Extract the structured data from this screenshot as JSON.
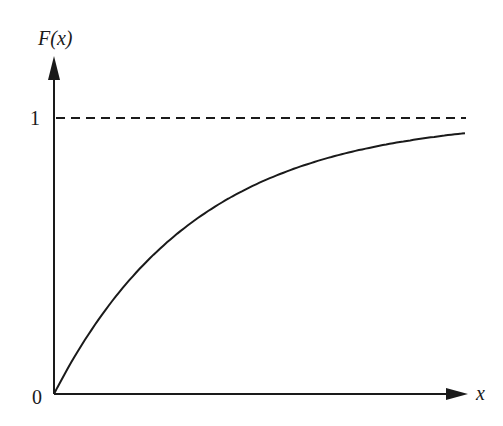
{
  "chart_data": {
    "type": "line",
    "title": "",
    "xlabel": "x",
    "ylabel": "F(x)",
    "y_ticks": [
      "0",
      "1"
    ],
    "x_ticks": [
      "0"
    ],
    "asymptote": {
      "y": 1,
      "style": "dashed"
    },
    "series": [
      {
        "name": "F(x) = 1 - e^(-kx)",
        "x": [
          0,
          0.5,
          1,
          1.5,
          2,
          2.5,
          2.9
        ],
        "values": [
          0,
          0.39,
          0.63,
          0.78,
          0.86,
          0.92,
          0.945
        ]
      }
    ],
    "ylim": [
      0,
      1.15
    ],
    "grid": false,
    "legend": "none"
  },
  "labels": {
    "y_axis": "F(x)",
    "x_axis": "x",
    "origin": "0",
    "one": "1"
  },
  "colors": {
    "ink": "#1a1a1a",
    "background": "#ffffff"
  }
}
